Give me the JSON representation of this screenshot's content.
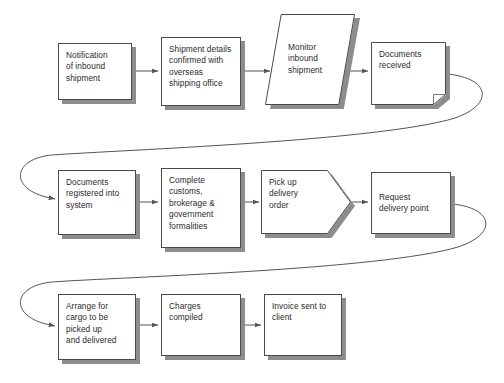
{
  "diagram": {
    "background_color": "#ffffff",
    "shape_fill": "#ffffff",
    "shape_border_color": "#4a4a4a",
    "shadow_color": "#8d8d8d",
    "text_color": "#2b2b2b",
    "connector_color": "#555555",
    "nodes": [
      {
        "id": "notification-of-inbound-shipment",
        "label": "Notification\nof inbound\nshipment",
        "shape": "rectangle",
        "row": 1,
        "x": 58,
        "y": 43,
        "w": 74,
        "h": 57
      },
      {
        "id": "shipment-details-confirmed",
        "label": "Shipment details\nconfirmed with\noverseas\nshipping office",
        "shape": "rectangle",
        "row": 1,
        "x": 161,
        "y": 37,
        "w": 80,
        "h": 69
      },
      {
        "id": "monitor-inbound-shipment",
        "label": "Monitor\ninbound\nshipment",
        "shape": "parallelogram",
        "row": 1,
        "x": 265,
        "y": 14,
        "w": 90,
        "h": 91
      },
      {
        "id": "documents-received",
        "label": "Documents\nreceived",
        "shape": "document",
        "row": 1,
        "x": 371,
        "y": 42,
        "w": 75,
        "h": 63
      },
      {
        "id": "documents-registered-into-system",
        "label": "Documents\nregistered into\nsystem",
        "shape": "rectangle",
        "row": 2,
        "x": 58,
        "y": 170,
        "w": 78,
        "h": 65
      },
      {
        "id": "complete-customs-formalities",
        "label": "Complete\ncustoms,\nbrokerage &\ngovernment\nformalities",
        "shape": "rectangle",
        "row": 2,
        "x": 161,
        "y": 168,
        "w": 80,
        "h": 80
      },
      {
        "id": "pick-up-delivery-order",
        "label": "Pick up\ndelivery\norder",
        "shape": "pentagon",
        "row": 2,
        "x": 261,
        "y": 170,
        "w": 90,
        "h": 64
      },
      {
        "id": "request-delivery-point",
        "label": "Request\ndelivery point",
        "shape": "rectangle",
        "row": 2,
        "x": 371,
        "y": 172,
        "w": 80,
        "h": 62
      },
      {
        "id": "arrange-for-cargo",
        "label": "Arrange for\ncargo to be\npicked up\nand delivered",
        "shape": "rectangle",
        "row": 3,
        "x": 58,
        "y": 294,
        "w": 78,
        "h": 66
      },
      {
        "id": "charges-compiled",
        "label": "Charges\ncompiled",
        "shape": "rectangle",
        "row": 3,
        "x": 161,
        "y": 294,
        "w": 80,
        "h": 62
      },
      {
        "id": "invoice-sent-to-client",
        "label": "Invoice sent to\nclient",
        "shape": "rectangle",
        "row": 3,
        "x": 264,
        "y": 294,
        "w": 78,
        "h": 62
      }
    ],
    "connectors": [
      {
        "id": "conn-notification-to-shipment",
        "type": "straight",
        "from": "notification-of-inbound-shipment",
        "to": "shipment-details-confirmed"
      },
      {
        "id": "conn-shipment-to-monitor",
        "type": "straight",
        "from": "shipment-details-confirmed",
        "to": "monitor-inbound-shipment"
      },
      {
        "id": "conn-monitor-to-documents",
        "type": "straight",
        "from": "monitor-inbound-shipment",
        "to": "documents-received"
      },
      {
        "id": "conn-documents-to-registered",
        "type": "curved-wrap",
        "from": "documents-received",
        "to": "documents-registered-into-system"
      },
      {
        "id": "conn-registered-to-complete",
        "type": "straight",
        "from": "documents-registered-into-system",
        "to": "complete-customs-formalities"
      },
      {
        "id": "conn-complete-to-pickup",
        "type": "straight",
        "from": "complete-customs-formalities",
        "to": "pick-up-delivery-order"
      },
      {
        "id": "conn-pickup-to-request",
        "type": "straight",
        "from": "pick-up-delivery-order",
        "to": "request-delivery-point"
      },
      {
        "id": "conn-request-to-arrange",
        "type": "curved-wrap",
        "from": "request-delivery-point",
        "to": "arrange-for-cargo"
      },
      {
        "id": "conn-arrange-to-charges",
        "type": "straight",
        "from": "arrange-for-cargo",
        "to": "charges-compiled"
      },
      {
        "id": "conn-charges-to-invoice",
        "type": "straight",
        "from": "charges-compiled",
        "to": "invoice-sent-to-client"
      }
    ]
  }
}
